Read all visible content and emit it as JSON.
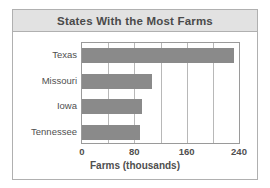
{
  "figure": {
    "border_color": "#b0b0b0",
    "header_bg": "#e2e2e2",
    "bar_color": "#8a8a8a",
    "text_color": "#4f4f4f"
  },
  "chart_data": {
    "type": "bar",
    "orientation": "horizontal",
    "title": "States With the Most Farms",
    "xlabel": "Farms (thousands)",
    "ylabel": "",
    "categories": [
      "Texas",
      "Missouri",
      "Iowa",
      "Tennessee"
    ],
    "values": [
      232,
      107,
      92,
      89
    ],
    "xticks": [
      0,
      80,
      160,
      240
    ],
    "xtick_labels": [
      "0",
      "80",
      "160",
      "240"
    ],
    "minor_gridlines": [
      40,
      80,
      120,
      160,
      200
    ],
    "xlim": [
      0,
      240
    ],
    "grid": true,
    "legend": false
  }
}
